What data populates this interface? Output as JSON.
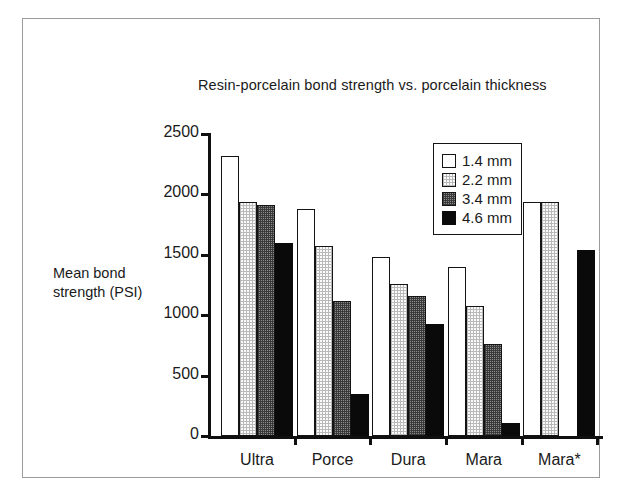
{
  "figure": {
    "title": "Resin-porcelain bond strength vs. porcelain thickness",
    "y_axis_title_line1": "Mean bond",
    "y_axis_title_line2": "strength (PSI)"
  },
  "chart_data": {
    "type": "bar",
    "title": "Resin-porcelain bond strength vs. porcelain thickness",
    "xlabel": "",
    "ylabel": "Mean bond strength (PSI)",
    "ylim": [
      0,
      2500
    ],
    "yticks": [
      0,
      500,
      1000,
      1500,
      2000,
      2500
    ],
    "ytick_labels": [
      "0",
      "500",
      "1000",
      "1500",
      "2000",
      "2500"
    ],
    "grid": false,
    "legend_position": "upper-right-inside",
    "categories": [
      "Ultra",
      "Porce",
      "Dura",
      "Mara",
      "Mara*"
    ],
    "series": [
      {
        "name": "1.4 mm",
        "values": [
          2320,
          1880,
          1480,
          1400,
          1940
        ]
      },
      {
        "name": "2.2 mm",
        "values": [
          1940,
          1570,
          1255,
          1080,
          1935
        ]
      },
      {
        "name": "3.4 mm",
        "values": [
          1910,
          1120,
          1160,
          760,
          0
        ]
      },
      {
        "name": "4.6 mm",
        "values": [
          1600,
          350,
          930,
          105,
          1540
        ]
      }
    ]
  }
}
